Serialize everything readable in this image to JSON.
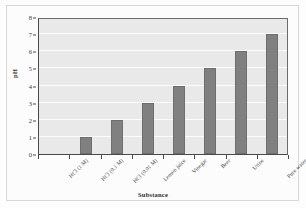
{
  "chart_data": {
    "type": "bar",
    "title": "",
    "xlabel": "Substance",
    "ylabel": "pH",
    "categories": [
      "HCl (1 M)",
      "HCl (0.1 M)",
      "HCl (0.01 M)",
      "Lemon juice",
      "Vinegar",
      "Beer",
      "Urine",
      "Pure water"
    ],
    "values": [
      0,
      1,
      2,
      3,
      4,
      5,
      6,
      7
    ],
    "ylim": [
      0,
      8
    ],
    "yticks": [
      0,
      1,
      2,
      3,
      4,
      5,
      6,
      7,
      8
    ],
    "ytick_labels": [
      "0",
      "1",
      "2",
      "3",
      "4",
      "5",
      "6",
      "7",
      "8"
    ],
    "grid": true,
    "grid_axis": "y",
    "legend": false,
    "bar_color": "#808080",
    "plot_background": "#e9e9e9",
    "gridline_color": "#fbfbfb",
    "axis_color": "#4a4a4a"
  }
}
